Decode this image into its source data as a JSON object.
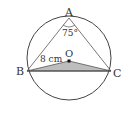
{
  "diagram": {
    "points": {
      "A": {
        "label": "A",
        "x": 69,
        "y": 18
      },
      "B": {
        "label": "B",
        "x": 27,
        "y": 71
      },
      "C": {
        "label": "C",
        "x": 111,
        "y": 71
      },
      "O": {
        "label": "O",
        "x": 69,
        "y": 61
      }
    },
    "circle": {
      "cx": 69,
      "cy": 58,
      "r": 42
    },
    "angle_label": "75°",
    "length_label": "8 cm",
    "colors": {
      "stroke": "#444444",
      "shade": "#bbbbbb",
      "text": "#333333"
    }
  }
}
